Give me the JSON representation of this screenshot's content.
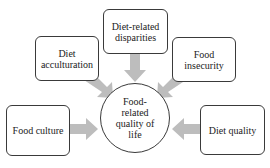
{
  "diagram": {
    "center": {
      "label": "Food-\nrelated\nquality of\nlife"
    },
    "nodes": [
      {
        "id": "diet-related-disparities",
        "label": "Diet-related\ndisparities"
      },
      {
        "id": "diet-acculturation",
        "label": "Diet\nacculturation"
      },
      {
        "id": "food-insecurity",
        "label": "Food\ninsecurity"
      },
      {
        "id": "food-culture",
        "label": "Food culture"
      },
      {
        "id": "diet-quality",
        "label": "Diet quality"
      }
    ],
    "edges": [
      {
        "from": "diet-related-disparities",
        "to": "center"
      },
      {
        "from": "diet-acculturation",
        "to": "center"
      },
      {
        "from": "food-insecurity",
        "to": "center"
      },
      {
        "from": "food-culture",
        "to": "center"
      },
      {
        "from": "diet-quality",
        "to": "center"
      }
    ],
    "colors": {
      "arrow": "#bdbdbd",
      "border": "#3a3a3a",
      "background": "#ffffff"
    }
  }
}
